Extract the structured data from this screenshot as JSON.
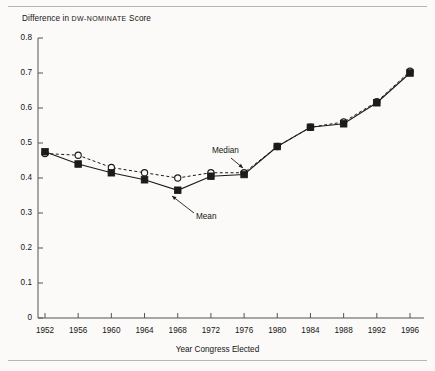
{
  "figure": {
    "title_prefix": "Difference in ",
    "title_smallcaps": "DW-NOMINATE",
    "title_suffix": " Score",
    "title_full": "Difference in DW-NOMINATE Score",
    "xaxis_title": "Year Congress Elected"
  },
  "labels": {
    "median": "Median",
    "mean": "Mean"
  },
  "colors": {
    "ink": "#141414",
    "line": "#1b1b1b",
    "axis": "#555555",
    "background": "#fbfaf8",
    "rule": "#b9b6b1"
  },
  "chart_data": {
    "type": "line",
    "title": "Difference in DW-NOMINATE Score",
    "xlabel": "Year Congress Elected",
    "ylabel": "Difference in DW-NOMINATE Score",
    "x": [
      1952,
      1956,
      1960,
      1964,
      1968,
      1972,
      1976,
      1980,
      1984,
      1988,
      1992,
      1996
    ],
    "xtick_labels": [
      "1952",
      "1956",
      "1960",
      "1964",
      "1968",
      "1972",
      "1976",
      "1980",
      "1984",
      "1988",
      "1992",
      "1996"
    ],
    "ytick_labels": [
      "0",
      "0.1",
      "0.2",
      "0.3",
      "0.4",
      "0.5",
      "0.6",
      "0.7",
      "0.8"
    ],
    "ytick_values": [
      0,
      0.1,
      0.2,
      0.3,
      0.4,
      0.5,
      0.6,
      0.7,
      0.8
    ],
    "xlim": [
      1952,
      1996
    ],
    "ylim": [
      0,
      0.8
    ],
    "grid": false,
    "legend": "inline-annotations",
    "series": [
      {
        "name": "Mean",
        "marker": "filled-square",
        "linestyle": "solid",
        "values": [
          0.475,
          0.44,
          0.415,
          0.395,
          0.365,
          0.405,
          0.41,
          0.49,
          0.545,
          0.555,
          0.615,
          0.7
        ]
      },
      {
        "name": "Median",
        "marker": "open-circle",
        "linestyle": "dashed",
        "values": [
          0.47,
          0.465,
          0.43,
          0.415,
          0.4,
          0.415,
          0.415,
          0.49,
          0.545,
          0.56,
          0.618,
          0.705
        ]
      }
    ],
    "annotations": [
      {
        "text": "Median",
        "points_to_year": 1972,
        "series": "Median"
      },
      {
        "text": "Mean",
        "points_to_year": 1968,
        "series": "Mean"
      }
    ]
  }
}
